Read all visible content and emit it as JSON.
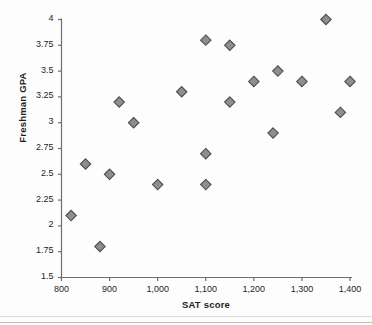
{
  "chart_data": {
    "type": "scatter",
    "title": "",
    "xlabel": "SAT score",
    "ylabel": "Freshman GPA",
    "xlim": [
      800,
      1400
    ],
    "ylim": [
      1.5,
      4
    ],
    "grid": false,
    "legend": "none",
    "marker": "diamond",
    "marker_fill": "#8e8e8e",
    "marker_edge": "#4d4d4d",
    "axis_color": "#6e6e6e",
    "xticks": [
      800,
      900,
      1000,
      1100,
      1200,
      1300,
      1400
    ],
    "xtick_labels": [
      "800",
      "900",
      "1,000",
      "1,100",
      "1,200",
      "1,300",
      "1,400"
    ],
    "yticks": [
      1.5,
      1.75,
      2,
      2.25,
      2.5,
      2.75,
      3,
      3.25,
      3.5,
      3.75,
      4
    ],
    "ytick_labels": [
      "1.5",
      "1.75",
      "2",
      "2.25",
      "2.5",
      "2.75",
      "3",
      "3.25",
      "3.5",
      "3.75",
      "4"
    ],
    "points": [
      {
        "x": 820,
        "y": 2.1
      },
      {
        "x": 850,
        "y": 2.6
      },
      {
        "x": 880,
        "y": 1.8
      },
      {
        "x": 900,
        "y": 2.5
      },
      {
        "x": 920,
        "y": 3.2
      },
      {
        "x": 950,
        "y": 3.0
      },
      {
        "x": 1000,
        "y": 2.4
      },
      {
        "x": 1050,
        "y": 3.3
      },
      {
        "x": 1100,
        "y": 3.8
      },
      {
        "x": 1100,
        "y": 2.7
      },
      {
        "x": 1100,
        "y": 2.4
      },
      {
        "x": 1150,
        "y": 3.75
      },
      {
        "x": 1150,
        "y": 3.2
      },
      {
        "x": 1200,
        "y": 3.4
      },
      {
        "x": 1240,
        "y": 2.9
      },
      {
        "x": 1250,
        "y": 3.5
      },
      {
        "x": 1300,
        "y": 3.4
      },
      {
        "x": 1350,
        "y": 4.0
      },
      {
        "x": 1380,
        "y": 3.1
      },
      {
        "x": 1400,
        "y": 3.4
      }
    ]
  }
}
